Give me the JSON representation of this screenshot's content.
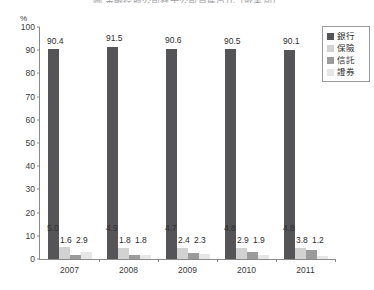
{
  "chart_data": {
    "type": "bar",
    "title": "圖  金融控股公司各子公司資產占比（依業別）",
    "xlabel": "",
    "ylabel": "%",
    "ylim": [
      0,
      100
    ],
    "ytick_step": 10,
    "yticks": [
      "100",
      "90",
      "80",
      "70",
      "60",
      "50",
      "40",
      "30",
      "20",
      "10",
      "0"
    ],
    "grid": false,
    "legend_position": "top-right",
    "categories": [
      "2007",
      "2008",
      "2009",
      "2010",
      "2011"
    ],
    "series": [
      {
        "name": "銀行",
        "color": "#555558",
        "values": [
          90.4,
          91.5,
          90.6,
          90.5,
          90.1
        ]
      },
      {
        "name": "保險",
        "color": "#d2d2d2",
        "values": [
          5.0,
          4.9,
          4.7,
          4.8,
          4.8
        ]
      },
      {
        "name": "信託",
        "color": "#9b9b9b",
        "values": [
          1.6,
          1.8,
          2.4,
          2.9,
          3.8
        ]
      },
      {
        "name": "證券",
        "color": "#e6e6e6",
        "values": [
          2.9,
          1.8,
          2.3,
          1.9,
          1.2
        ]
      }
    ],
    "data_labels": [
      {
        "category": "2007",
        "banking": "90.4",
        "insurance": "5.0",
        "trust": "1.6",
        "securities": "2.9"
      },
      {
        "category": "2008",
        "banking": "91.5",
        "insurance": "4.9",
        "trust": "1.8",
        "securities": "1.8"
      },
      {
        "category": "2009",
        "banking": "90.6",
        "insurance": "4.7",
        "trust": "2.4",
        "securities": "2.3"
      },
      {
        "category": "2010",
        "banking": "90.5",
        "insurance": "4.8",
        "trust": "2.9",
        "securities": "1.9"
      },
      {
        "category": "2011",
        "banking": "90.1",
        "insurance": "4.8",
        "trust": "3.8",
        "securities": "1.2"
      }
    ]
  },
  "axis": {
    "unit": "%"
  },
  "legend": {
    "items": [
      {
        "label": "銀行",
        "color": "#555558"
      },
      {
        "label": "保險",
        "color": "#d2d2d2"
      },
      {
        "label": "信託",
        "color": "#9b9b9b"
      },
      {
        "label": "證券",
        "color": "#e6e6e6"
      }
    ]
  }
}
